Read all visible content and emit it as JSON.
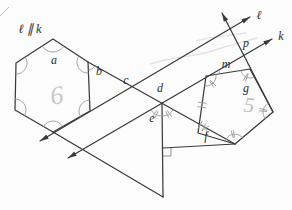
{
  "figure": {
    "given": "ℓ ∥ k",
    "labels": {
      "a": "a",
      "b": "b",
      "c": "c",
      "d": "d",
      "e": "e",
      "f": "f",
      "g": "g",
      "m": "m",
      "p": "p",
      "line_l": "ℓ",
      "line_k": "k"
    },
    "pencil_marks": {
      "hexagon": "6",
      "pentagon": "5"
    },
    "colors": {
      "ink": "#3a3a3a",
      "arc": "#9b9b9b",
      "pencil": "#c9c9c9",
      "paper": "#fcfcfc"
    }
  }
}
